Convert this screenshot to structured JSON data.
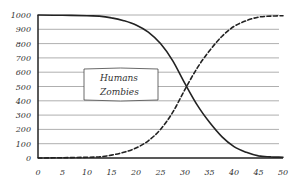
{
  "chart_data": {
    "type": "line",
    "title": "",
    "xlabel": "",
    "ylabel": "",
    "xlim": [
      0,
      50
    ],
    "ylim": [
      0,
      1000
    ],
    "grid": {
      "horizontal": true,
      "vertical": false
    },
    "x_ticks": [
      "0",
      "5",
      "10",
      "15",
      "20",
      "25",
      "30",
      "35",
      "40",
      "45",
      "50"
    ],
    "y_ticks": [
      "0",
      "100",
      "200",
      "300",
      "400",
      "500",
      "600",
      "700",
      "800",
      "900",
      "1000"
    ],
    "legend": {
      "position": "inside-left-middle",
      "entries": [
        "Humans",
        "Zombies"
      ]
    },
    "x": [
      0,
      5,
      10,
      12.5,
      15,
      17.5,
      20,
      22.5,
      25,
      27.5,
      30,
      32.5,
      35,
      37.5,
      40,
      42.5,
      45,
      47.5,
      50
    ],
    "series": [
      {
        "name": "Humans",
        "style": "solid",
        "color": "#222222",
        "values": [
          1000,
          998,
          995,
          992,
          980,
          960,
          930,
          880,
          800,
          680,
          520,
          370,
          250,
          150,
          80,
          40,
          15,
          8,
          5
        ]
      },
      {
        "name": "Zombies",
        "style": "dashed",
        "color": "#222222",
        "values": [
          0,
          2,
          5,
          8,
          20,
          40,
          70,
          120,
          200,
          320,
          480,
          630,
          750,
          850,
          920,
          960,
          985,
          992,
          995
        ]
      }
    ]
  },
  "colors": {
    "background": "#ffffff",
    "axis": "#222222",
    "grid": "#9a9a9a",
    "line": "#222222",
    "text": "#333333"
  }
}
